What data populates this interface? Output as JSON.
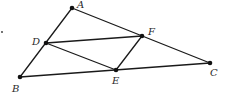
{
  "diagram": {
    "type": "geometry",
    "points": [
      {
        "id": "A",
        "label": "A",
        "x": 72,
        "y": 8,
        "lx": 77,
        "ly": 8
      },
      {
        "id": "B",
        "label": "B",
        "x": 20,
        "y": 77,
        "lx": 12,
        "ly": 92
      },
      {
        "id": "C",
        "label": "C",
        "x": 210,
        "y": 63,
        "lx": 210,
        "ly": 76
      },
      {
        "id": "D",
        "label": "D",
        "x": 46,
        "y": 43,
        "lx": 32,
        "ly": 45
      },
      {
        "id": "E",
        "label": "E",
        "x": 116,
        "y": 70,
        "lx": 112,
        "ly": 84
      },
      {
        "id": "F",
        "label": "F",
        "x": 142,
        "y": 36,
        "lx": 148,
        "ly": 35
      }
    ],
    "segments": [
      {
        "from": "A",
        "to": "B"
      },
      {
        "from": "A",
        "to": "C"
      },
      {
        "from": "B",
        "to": "C"
      },
      {
        "from": "D",
        "to": "F"
      },
      {
        "from": "D",
        "to": "E"
      },
      {
        "from": "E",
        "to": "F"
      }
    ],
    "stray_mark": {
      "x": 2,
      "y": 32
    }
  }
}
